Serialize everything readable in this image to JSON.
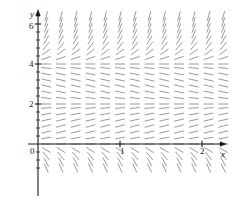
{
  "figure": {
    "kind": "slope-field",
    "background": "#ffffff",
    "axis_color": "#1a1a1a",
    "segment_color": "#9a9a9a"
  },
  "axes": {
    "x_axis_label": "x",
    "y_axis_label": "y",
    "origin_label": "0",
    "x_ticks": [
      {
        "value": 1,
        "label": "1"
      },
      {
        "value": 2,
        "label": "2"
      }
    ],
    "y_ticks": [
      {
        "value": 2,
        "label": "2"
      },
      {
        "value": 4,
        "label": "4"
      },
      {
        "value": 6,
        "label": "6"
      }
    ],
    "x_minor_tick_step": 0.2,
    "y_minor_tick_step": 0.4,
    "xlim": [
      -0.12,
      2.35
    ],
    "ylim": [
      -1.3,
      6.6
    ],
    "grid": false,
    "arrowheads": [
      "x-positive",
      "y-positive"
    ]
  },
  "chart_data": {
    "type": "scatter",
    "title": "",
    "xlabel": "x",
    "ylabel": "y",
    "xlim": [
      -0.12,
      2.35
    ],
    "ylim": [
      -1.3,
      6.6
    ],
    "grid": false,
    "legend": "none",
    "equation": "dy/dx = f(y)",
    "equilibria": [
      0,
      2,
      4
    ],
    "sample_x": [
      0.1,
      0.28,
      0.46,
      0.64,
      0.82,
      1.0,
      1.18,
      1.36,
      1.54,
      1.72,
      1.9,
      2.08,
      2.26
    ],
    "sample_y": [
      -1.2,
      -0.9,
      -0.6,
      -0.3,
      0.0,
      0.3,
      0.6,
      0.9,
      1.2,
      1.5,
      1.8,
      2.0,
      2.3,
      2.6,
      2.9,
      3.2,
      3.5,
      3.8,
      4.0,
      4.3,
      4.6,
      4.9,
      5.2,
      5.5,
      5.8,
      6.1,
      6.4
    ],
    "slope_rule": {
      "form": "sign and magnitude of dy/dx depend only on y",
      "samples": [
        {
          "y": -1.2,
          "slope": -9.0
        },
        {
          "y": -0.9,
          "slope": -7.5
        },
        {
          "y": -0.6,
          "slope": -5.0
        },
        {
          "y": -0.3,
          "slope": -2.5
        },
        {
          "y": 0.0,
          "slope": 0.0
        },
        {
          "y": 0.3,
          "slope": 0.7
        },
        {
          "y": 0.6,
          "slope": 1.0
        },
        {
          "y": 0.9,
          "slope": 1.1
        },
        {
          "y": 1.2,
          "slope": 1.0
        },
        {
          "y": 1.5,
          "slope": 0.75
        },
        {
          "y": 1.8,
          "slope": 0.35
        },
        {
          "y": 2.0,
          "slope": 0.0
        },
        {
          "y": 2.3,
          "slope": -0.5
        },
        {
          "y": 2.6,
          "slope": -0.85
        },
        {
          "y": 2.9,
          "slope": -1.0
        },
        {
          "y": 3.2,
          "slope": -1.0
        },
        {
          "y": 3.5,
          "slope": -0.8
        },
        {
          "y": 3.8,
          "slope": -0.4
        },
        {
          "y": 4.0,
          "slope": 0.0
        },
        {
          "y": 4.3,
          "slope": 1.4
        },
        {
          "y": 4.6,
          "slope": 3.0
        },
        {
          "y": 4.9,
          "slope": 5.0
        },
        {
          "y": 5.2,
          "slope": 7.0
        },
        {
          "y": 5.5,
          "slope": 9.0
        },
        {
          "y": 5.8,
          "slope": 11.0
        },
        {
          "y": 6.1,
          "slope": 13.0
        },
        {
          "y": 6.4,
          "slope": 15.0
        }
      ]
    }
  }
}
